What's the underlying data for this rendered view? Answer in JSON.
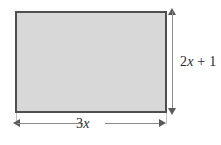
{
  "figure": {
    "type": "geometry-diagram",
    "shape": "rectangle",
    "fill_color": "#d8d8d8",
    "border_color": "#4f4f4f",
    "dimension_line_color": "#8a8a8a",
    "background_color": "#ffffff",
    "labels": {
      "height": {
        "full_text": "2x + 1",
        "coefficient": "2",
        "variable": "x",
        "operator": "+",
        "constant": "1",
        "position": "right"
      },
      "width": {
        "full_text": "3x",
        "coefficient": "3",
        "variable": "x",
        "position": "bottom"
      }
    }
  }
}
